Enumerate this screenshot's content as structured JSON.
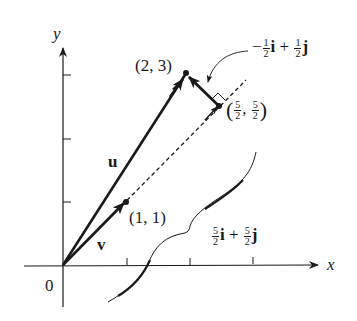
{
  "figure": {
    "type": "vector-projection-diagram",
    "axes": {
      "x_label": "x",
      "y_label": "y",
      "origin_label": "0",
      "x_ticks": [
        1,
        2,
        3
      ],
      "y_ticks": [
        1,
        2,
        3
      ]
    },
    "vectors": {
      "u": {
        "label": "u",
        "from": [
          0,
          0
        ],
        "to": [
          2,
          3
        ]
      },
      "v": {
        "label": "v",
        "from": [
          0,
          0
        ],
        "to": [
          1,
          1
        ]
      },
      "projection": {
        "from": [
          0,
          0
        ],
        "to": [
          2.5,
          2.5
        ],
        "style": "dashed"
      },
      "orthogonal": {
        "from": [
          2.5,
          2.5
        ],
        "to": [
          2,
          3
        ]
      }
    },
    "points": {
      "p23": {
        "label": "(2, 3)"
      },
      "p11": {
        "label": "(1, 1)"
      },
      "p2525": {
        "open": "(",
        "num1": "5",
        "den1": "2",
        "sep": ",",
        "num2": "5",
        "den2": "2",
        "close": ")"
      }
    },
    "annotations": {
      "orth_expr": {
        "minus": "−",
        "num1": "1",
        "den1": "2",
        "i": "i",
        "plus": "+",
        "num2": "1",
        "den2": "2",
        "j": "j"
      },
      "proj_expr": {
        "num1": "5",
        "den1": "2",
        "i": "i",
        "plus": "+",
        "num2": "5",
        "den2": "2",
        "j": "j"
      }
    }
  }
}
